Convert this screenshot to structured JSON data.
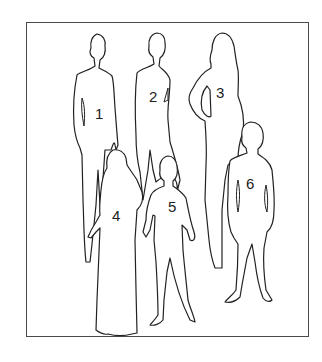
{
  "figure": {
    "frame_color": "#4a4a4a",
    "line_color": "#222222",
    "labels": [
      {
        "id": 1,
        "text": "1"
      },
      {
        "id": 2,
        "text": "2"
      },
      {
        "id": 3,
        "text": "3"
      },
      {
        "id": 4,
        "text": "4"
      },
      {
        "id": 5,
        "text": "5"
      },
      {
        "id": 6,
        "text": "6"
      }
    ]
  }
}
